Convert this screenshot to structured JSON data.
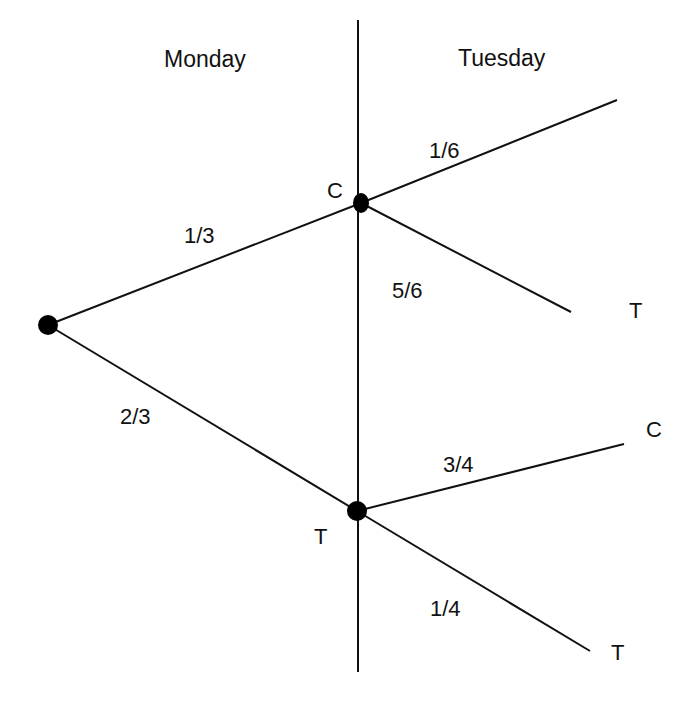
{
  "diagram": {
    "type": "probability-tree",
    "headers": {
      "left": "Monday",
      "right": "Tuesday"
    },
    "nodes": {
      "root": {
        "x": 48,
        "y": 325
      },
      "monday_c": {
        "x": 361,
        "y": 203,
        "label": "C"
      },
      "monday_t": {
        "x": 357,
        "y": 511,
        "label": "T"
      }
    },
    "branches": [
      {
        "from": "root",
        "to": "monday_c",
        "prob": "1/3"
      },
      {
        "from": "root",
        "to": "monday_t",
        "prob": "2/3"
      },
      {
        "from": "monday_c",
        "to_end": [
          617,
          100
        ],
        "prob": "1/6",
        "outcome": ""
      },
      {
        "from": "monday_c",
        "to_end": [
          571,
          312
        ],
        "prob": "5/6",
        "outcome": "T"
      },
      {
        "from": "monday_t",
        "to_end": [
          624,
          444
        ],
        "prob": "3/4",
        "outcome": "C"
      },
      {
        "from": "monday_t",
        "to_end": [
          590,
          651
        ],
        "prob": "1/4",
        "outcome": "T"
      }
    ],
    "divider": {
      "x": 358,
      "y1": 20,
      "y2": 672
    },
    "colors": {
      "line": "#111111",
      "node": "#000000",
      "background": "#ffffff"
    }
  }
}
